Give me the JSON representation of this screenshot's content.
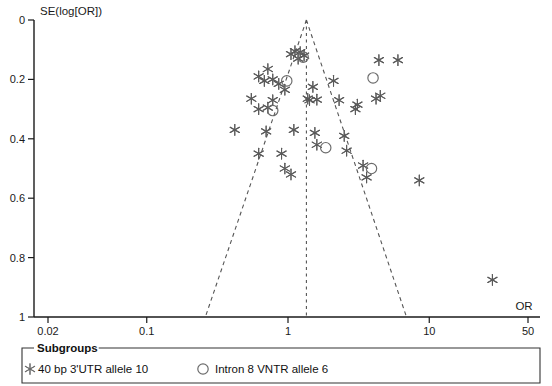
{
  "chart_data": {
    "type": "scatter",
    "title": "",
    "subtitle": "",
    "xlabel": "OR",
    "ylabel": "SE(log[OR])",
    "xscale": "log",
    "xlim": [
      0.02,
      50
    ],
    "ylim": [
      1,
      0
    ],
    "y_inverted": true,
    "grid": false,
    "xticks": [
      {
        "value": 0.02,
        "label": "0.02"
      },
      {
        "value": 0.1,
        "label": "0.1"
      },
      {
        "value": 1,
        "label": "1"
      },
      {
        "value": 10,
        "label": "10"
      },
      {
        "value": 50,
        "label": "50"
      }
    ],
    "yticks": [
      {
        "value": 0,
        "label": "0"
      },
      {
        "value": 0.2,
        "label": "0.2"
      },
      {
        "value": 0.4,
        "label": "0.4"
      },
      {
        "value": 0.6,
        "label": "0.6"
      },
      {
        "value": 0.8,
        "label": "0.8"
      },
      {
        "value": 1,
        "label": "1"
      }
    ],
    "reference_line": {
      "x": 1.35,
      "style": "dashed",
      "color": "#555555"
    },
    "funnel_lines": {
      "apex": {
        "x": 1.35,
        "y": 0.0
      },
      "left_base": {
        "x": 0.26,
        "y": 1.0
      },
      "right_base": {
        "x": 6.9,
        "y": 1.0
      },
      "style": "dashed",
      "color": "#555555"
    },
    "series": [
      {
        "name": "40 bp 3'UTR allele 10",
        "marker": "asterisk",
        "color": "#5a5a5a",
        "points": [
          {
            "x": 1.05,
            "y": 0.115
          },
          {
            "x": 1.12,
            "y": 0.105
          },
          {
            "x": 1.22,
            "y": 0.108
          },
          {
            "x": 1.3,
            "y": 0.12
          },
          {
            "x": 1.18,
            "y": 0.13
          },
          {
            "x": 0.72,
            "y": 0.165
          },
          {
            "x": 0.62,
            "y": 0.19
          },
          {
            "x": 0.68,
            "y": 0.205
          },
          {
            "x": 0.78,
            "y": 0.2
          },
          {
            "x": 0.86,
            "y": 0.215
          },
          {
            "x": 0.95,
            "y": 0.235
          },
          {
            "x": 0.55,
            "y": 0.265
          },
          {
            "x": 0.78,
            "y": 0.27
          },
          {
            "x": 0.62,
            "y": 0.3
          },
          {
            "x": 0.72,
            "y": 0.295
          },
          {
            "x": 1.5,
            "y": 0.225
          },
          {
            "x": 1.42,
            "y": 0.27
          },
          {
            "x": 1.6,
            "y": 0.268
          },
          {
            "x": 1.38,
            "y": 0.265
          },
          {
            "x": 2.1,
            "y": 0.205
          },
          {
            "x": 2.3,
            "y": 0.27
          },
          {
            "x": 3.1,
            "y": 0.285
          },
          {
            "x": 3.0,
            "y": 0.3
          },
          {
            "x": 4.4,
            "y": 0.135
          },
          {
            "x": 6.0,
            "y": 0.135
          },
          {
            "x": 4.2,
            "y": 0.265
          },
          {
            "x": 4.5,
            "y": 0.255
          },
          {
            "x": 0.42,
            "y": 0.37
          },
          {
            "x": 0.7,
            "y": 0.375
          },
          {
            "x": 1.1,
            "y": 0.37
          },
          {
            "x": 1.55,
            "y": 0.38
          },
          {
            "x": 1.6,
            "y": 0.42
          },
          {
            "x": 2.5,
            "y": 0.39
          },
          {
            "x": 2.6,
            "y": 0.44
          },
          {
            "x": 0.62,
            "y": 0.45
          },
          {
            "x": 0.9,
            "y": 0.45
          },
          {
            "x": 0.95,
            "y": 0.5
          },
          {
            "x": 1.05,
            "y": 0.52
          },
          {
            "x": 3.4,
            "y": 0.49
          },
          {
            "x": 3.6,
            "y": 0.53
          },
          {
            "x": 8.5,
            "y": 0.54
          },
          {
            "x": 28.0,
            "y": 0.875
          }
        ]
      },
      {
        "name": "Intron 8 VNTR allele 6",
        "marker": "circle",
        "color": "#6b6b6b",
        "points": [
          {
            "x": 1.28,
            "y": 0.125
          },
          {
            "x": 0.98,
            "y": 0.205
          },
          {
            "x": 4.0,
            "y": 0.195
          },
          {
            "x": 0.78,
            "y": 0.305
          },
          {
            "x": 1.85,
            "y": 0.43
          },
          {
            "x": 3.9,
            "y": 0.5
          }
        ]
      }
    ]
  },
  "legend": {
    "title": "Subgroups",
    "entries": [
      {
        "marker": "asterisk",
        "label": "40 bp 3'UTR allele 10"
      },
      {
        "marker": "circle",
        "label": "Intron 8 VNTR allele 6"
      }
    ]
  }
}
